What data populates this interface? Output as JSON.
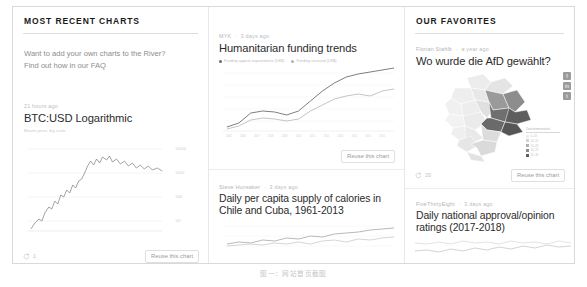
{
  "columns": {
    "left": {
      "heading": "MOST RECENT CHARTS",
      "promo": {
        "line1": "Want to add your own charts to the River?",
        "line2": "Find out how in our FAQ"
      },
      "card": {
        "byline_time": "21 hours ago",
        "title": "BTC:USD Logarithmic",
        "subtitle": "Bitcoin price, log scale",
        "reuse_count": "1",
        "reuse_label": "Reuse this chart",
        "yticks": [
          "100000",
          "10000",
          "1000",
          "100"
        ]
      }
    },
    "middle": {
      "card_top": {
        "byline_author": "MYK",
        "byline_time": "3 days ago",
        "title": "Humanitarian funding trends",
        "legend": [
          {
            "label": "Funding appeal requirements (US$)",
            "color": "#6b6b6b"
          },
          {
            "label": "Funding received (US$)",
            "color": "#b0b0b0"
          }
        ],
        "reuse_label": "Reuse this chart"
      },
      "card_bottom": {
        "byline_author": "Steve Hunsaker",
        "byline_time": "3 days ago",
        "title": "Daily per capita supply of calories in Chile and Cuba, 1961-2013"
      }
    },
    "right": {
      "heading": "OUR FAVORITES",
      "card_top": {
        "byline_author": "Florian Stahlb",
        "byline_time": "a year ago",
        "title": "Wo wurde die AfD gewählt?",
        "reuse_count": "20",
        "reuse_label": "Reuse this chart",
        "share_buttons": [
          "f",
          "in",
          "t"
        ],
        "map_legend": {
          "title": "Zweitstimmenanteil",
          "rows": [
            {
              "label": "0–10",
              "color": "#ededed"
            },
            {
              "label": "10–15",
              "color": "#d4d4d4"
            },
            {
              "label": "15–20",
              "color": "#b0b0b0"
            },
            {
              "label": "20–25",
              "color": "#8a8a8a"
            },
            {
              "label": "25–35",
              "color": "#5e5e5e"
            }
          ]
        }
      },
      "card_bottom": {
        "byline_author": "FiveThirtyEight",
        "byline_time": "3 days ago",
        "title": "Daily national approval/opinion ratings (2017-2018)"
      }
    }
  },
  "caption": "图一：网站首页截图"
}
